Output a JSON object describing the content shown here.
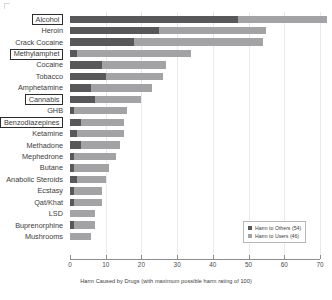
{
  "chart_data": {
    "type": "bar",
    "orientation": "horizontal",
    "stacked": true,
    "title": "",
    "xlabel": "Harm Caused by Drugs (with maximum possible harm rating of 100)",
    "ylabel": "",
    "xlim": [
      0,
      70
    ],
    "xticks": [
      0,
      10,
      20,
      30,
      40,
      50,
      60,
      70
    ],
    "xticklabels": [
      "0",
      "10",
      "20",
      "30",
      "40",
      "50",
      "60",
      "70"
    ],
    "grid": true,
    "legend_position": "lower-right",
    "categories": [
      "Alcohol",
      "Heroin",
      "Crack Cocaine",
      "Methylamphet",
      "Cocaine",
      "Tobacco",
      "Amphetamine",
      "Cannabis",
      "GHB",
      "Benzodiazepines",
      "Ketamine",
      "Methadone",
      "Mephedrone",
      "Butane",
      "Anabolic Steroids",
      "Ecstasy",
      "Qat/Khat",
      "LSD",
      "Buprenorphine",
      "Mushrooms"
    ],
    "highlighted_categories": [
      "Alcohol",
      "Methylamphet",
      "Cannabis",
      "Benzodiazepines"
    ],
    "series": [
      {
        "name": "Harm to Others (54)",
        "color": "#58585a",
        "values": [
          47,
          25,
          18,
          2,
          9,
          10,
          6,
          7,
          1,
          3,
          2,
          3,
          1,
          1,
          2,
          1,
          1,
          0,
          1,
          0
        ]
      },
      {
        "name": "Harm to Users (46)",
        "color": "#a3a3a5",
        "values": [
          25,
          30,
          36,
          32,
          18,
          16,
          17,
          13,
          15,
          12,
          13,
          11,
          12,
          10,
          8,
          8,
          8,
          7,
          6,
          6
        ]
      }
    ],
    "totals": [
      72,
      55,
      54,
      34,
      27,
      26,
      23,
      20,
      16,
      15,
      15,
      14,
      13,
      11,
      10,
      9,
      9,
      7,
      7,
      6
    ]
  },
  "legend": {
    "items": [
      {
        "label": "Harm to Others (54)",
        "color": "#58585a"
      },
      {
        "label": "Harm to Users (46)",
        "color": "#a3a3a5"
      }
    ]
  },
  "colors": {
    "harm_to_others": "#58585a",
    "harm_to_users": "#a3a3a5",
    "axis": "#8d8d8d",
    "grid": "#e9e9e9",
    "text": "#3c3c3c",
    "background": "#ffffff"
  }
}
